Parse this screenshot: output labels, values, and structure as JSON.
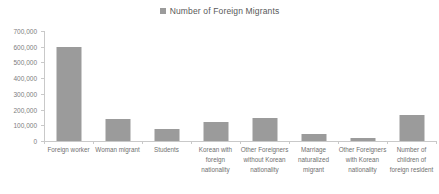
{
  "legend": {
    "swatch_name": "legend-color-swatch",
    "swatch_color": "#9b9b9b",
    "label": "Number of Foreign Migrants"
  },
  "axes": {
    "y_tick_labels": [
      "700,000",
      "600,000",
      "500,000",
      "400,000",
      "300,000",
      "200,000",
      "100,000",
      "0"
    ],
    "y_tick_values": [
      700000,
      600000,
      500000,
      400000,
      300000,
      200000,
      100000,
      0
    ]
  },
  "chart_data": {
    "type": "bar",
    "title": "Number of Foreign Migrants",
    "xlabel": "",
    "ylabel": "",
    "ylim": [
      0,
      700000
    ],
    "ytick_step": 100000,
    "grid": false,
    "legend_position": "top-center",
    "bar_color": "#9b9b9b",
    "categories": [
      "Foreign worker",
      "Woman migrant",
      "Students",
      "Korean with foreign nationality",
      "Other Foreigners without Korean nationality",
      "Marriage naturalized migrant",
      "Other Foreigners with Korean nationality",
      "Number of children of foreign resident"
    ],
    "category_labels_wrapped": [
      "Foreign worker",
      "Woman migrant",
      "Students",
      "Korean with\nforeign\nnationality",
      "Other Foreigners\nwithout Korean\nnationality",
      "Marriage\nnaturalized\nmigrant",
      "Other Foreigners\nwith Korean\nnationality",
      "Number of\nchildren of\nforeign resident"
    ],
    "series": [
      {
        "name": "Number of Foreign Migrants",
        "values": [
          598000,
          140000,
          76000,
          123000,
          146000,
          45000,
          18000,
          165000
        ]
      }
    ]
  }
}
